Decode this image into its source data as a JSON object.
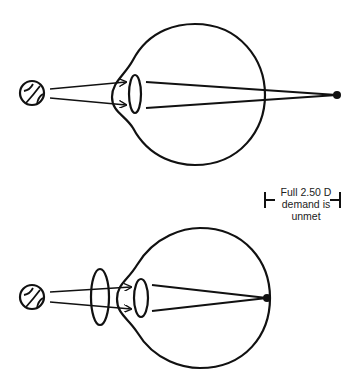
{
  "annotation": {
    "line1": "Full 2.50 D",
    "line2": "demand is",
    "line3": "unmet"
  },
  "diagrams": [
    {
      "name": "top-eye-unaided",
      "object": "ball",
      "focus": "behind retina"
    },
    {
      "name": "bottom-eye-corrected",
      "object": "ball",
      "focus": "on retina",
      "correction": "plus lens"
    }
  ],
  "colors": {
    "stroke": "#111111",
    "background": "#ffffff"
  }
}
